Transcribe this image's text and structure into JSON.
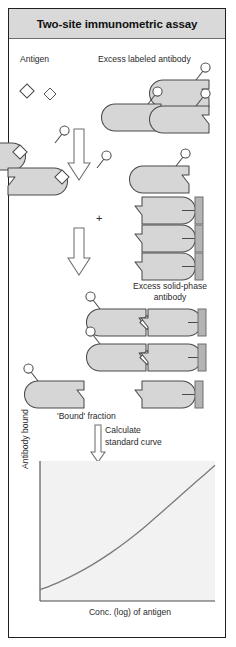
{
  "figure": {
    "title": "Two-site immunometric assay",
    "title_bg": "#d9d9d9",
    "border_color": "#231f20",
    "shape_fill": "#d6d6d6",
    "shape_stroke": "#4a4a4a",
    "label_color": "#2a2a2a"
  },
  "labels": {
    "antigen": "Antigen",
    "excess_labeled_antibody": "Excess labeled antibody",
    "plus": "+",
    "excess_solid_phase_line1": "Excess solid-phase",
    "excess_solid_phase_line2": "antibody",
    "bound_fraction": "'Bound' fraction",
    "calculate_line1": "Calculate",
    "calculate_line2": "standard curve"
  },
  "chart_data": {
    "type": "line",
    "title": "",
    "xlabel": "Conc. (log) of antigen",
    "ylabel": "Antibody bound",
    "grid": false,
    "legend": "none",
    "xlim": [
      0,
      100
    ],
    "ylim": [
      0,
      100
    ],
    "xticks": [],
    "yticks": [],
    "series": [
      {
        "name": "standard curve",
        "x": [
          0,
          10,
          20,
          30,
          40,
          50,
          60,
          70,
          80,
          90,
          100
        ],
        "y": [
          8,
          13,
          19,
          26,
          34,
          43,
          53,
          64,
          75,
          86,
          97
        ]
      }
    ]
  },
  "stages": {
    "antigen_count": 2,
    "labeled_antibody_count": 3,
    "antigen_bound_count": 2,
    "solid_phase_count": 3,
    "complex_count": 2,
    "free_labeled_count": 1,
    "free_solid_phase_count": 1
  }
}
